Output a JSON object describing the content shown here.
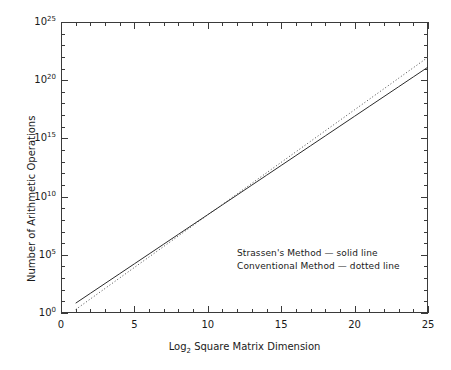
{
  "chart_data": {
    "type": "line",
    "title": "",
    "subtitle": "",
    "xlabel": "Log2 Square Matrix Dimension",
    "xlabel_base": "Log",
    "xlabel_sub": "2",
    "xlabel_rest": " Square Matrix Dimension",
    "ylabel": "Number of Arithmetic Operations",
    "xlim": [
      0,
      25
    ],
    "ylim_log10": [
      0,
      25
    ],
    "yscale": "log",
    "grid": false,
    "legend_position": "inside-bottom-right",
    "x_ticks": [
      0,
      5,
      10,
      15,
      20,
      25
    ],
    "x_tick_labels": [
      "0",
      "5",
      "10",
      "15",
      "20",
      "25"
    ],
    "x_minor_step": 1,
    "y_ticks_log10": [
      0,
      5,
      10,
      15,
      20,
      25
    ],
    "y_tick_labels": [
      "10^0",
      "10^5",
      "10^10",
      "10^15",
      "10^20",
      "10^25"
    ],
    "y_tick_mantissa": "10",
    "y_tick_exponents": [
      "0",
      "5",
      "10",
      "15",
      "20",
      "25"
    ],
    "y_minor_step_log10": 1,
    "x": [
      1,
      2,
      3,
      4,
      5,
      6,
      7,
      8,
      9,
      10,
      11,
      12,
      13,
      14,
      15,
      16,
      17,
      18,
      19,
      20,
      21,
      22,
      23,
      24,
      25
    ],
    "series": [
      {
        "name": "Strassen's Method",
        "style": "solid",
        "color": "#2b2b2b",
        "legend_text": "Strassen's Method — solid line",
        "values_log10": [
          0.845,
          1.69,
          2.535,
          3.38,
          4.225,
          5.071,
          5.916,
          6.761,
          7.606,
          8.451,
          9.296,
          10.141,
          10.986,
          11.831,
          12.676,
          13.521,
          14.367,
          15.212,
          16.057,
          16.902,
          17.747,
          18.592,
          19.437,
          20.282,
          21.127
        ]
      },
      {
        "name": "Conventional Method",
        "style": "dotted",
        "color": "#4a4a4a",
        "legend_text": "Conventional Method — dotted line",
        "values_log10": [
          0.301,
          1.204,
          2.107,
          3.01,
          3.913,
          4.816,
          5.719,
          6.623,
          7.526,
          8.429,
          9.332,
          10.235,
          11.138,
          12.041,
          12.944,
          13.847,
          14.75,
          15.654,
          16.557,
          17.46,
          18.363,
          19.266,
          20.169,
          21.072,
          21.975
        ]
      }
    ],
    "annotations": []
  },
  "axes": {
    "frame_color": "#3a3a3a"
  }
}
